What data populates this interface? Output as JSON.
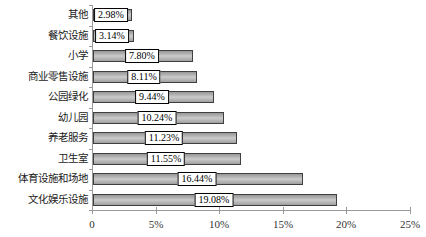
{
  "chart_data": {
    "type": "bar",
    "orientation": "horizontal",
    "title": "",
    "xlabel": "",
    "ylabel": "",
    "grid": false,
    "legend": null,
    "categories": [
      "其他",
      "餐饮设施",
      "小学",
      "商业零售设施",
      "公园绿化",
      "幼儿园",
      "养老服务",
      "卫生室",
      "体育设施和场地",
      "文化娱乐设施"
    ],
    "values": [
      2.98,
      3.14,
      7.8,
      8.11,
      9.44,
      10.24,
      11.23,
      11.55,
      16.44,
      19.08
    ],
    "value_labels": [
      "2.98%",
      "3.14%",
      "7.80%",
      "8.11%",
      "9.44%",
      "10.24%",
      "11.23%",
      "11.55%",
      "16.44%",
      "19.08%"
    ],
    "value_label_style": "white box centered on bar",
    "x_axis": {
      "tick_labels": [
        "0",
        "5%",
        "10%",
        "15%",
        "20%",
        "25%"
      ],
      "tick_values": [
        0,
        5,
        10,
        15,
        20,
        25
      ],
      "min": 0,
      "max": 25
    },
    "colors": {
      "bar_fill": "#a9a9a9",
      "bar_highlight": "#cbcbcb",
      "bar_border": "#3f3f3f",
      "axis": "#9a9a9a",
      "label_box_bg": "#ffffff",
      "label_box_border": "#000000",
      "text": "#1a1a1a",
      "background": "#ffffff"
    }
  }
}
